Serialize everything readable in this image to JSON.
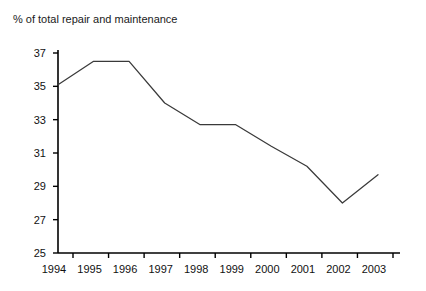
{
  "chart_data": {
    "type": "line",
    "title": "% of total repair and maintenance",
    "xlabel": "",
    "ylabel": "% of total repair and maintenance",
    "categories": [
      "1994",
      "1995",
      "1996",
      "1997",
      "1998",
      "1999",
      "2000",
      "2001",
      "2002",
      "2003"
    ],
    "values": [
      35.1,
      36.5,
      36.5,
      34.0,
      32.7,
      32.7,
      31.4,
      30.2,
      28.0,
      29.7
    ],
    "series": [
      {
        "name": "% of total repair and maintenance",
        "values": [
          35.1,
          36.5,
          36.5,
          34.0,
          32.7,
          32.7,
          31.4,
          30.2,
          28.0,
          29.7
        ]
      }
    ],
    "ylim": [
      25,
      37
    ],
    "xlim": [
      "1994",
      "2003"
    ],
    "yticks": [
      25,
      27,
      29,
      31,
      33,
      35,
      37
    ],
    "ytick_labels": [
      "25",
      "27",
      "29",
      "31",
      "33",
      "35",
      "37"
    ],
    "xtick_labels": [
      "1994",
      "1995",
      "1996",
      "1997",
      "1998",
      "1999",
      "2000",
      "2001",
      "2002",
      "2003"
    ],
    "grid": false,
    "legend": false,
    "legend_position": "none",
    "line_color": "#3a3a3a",
    "axis_color": "#000000"
  },
  "colors": {
    "background": "#ffffff",
    "line": "#3a3a3a",
    "axis": "#000000",
    "text": "#111111"
  }
}
